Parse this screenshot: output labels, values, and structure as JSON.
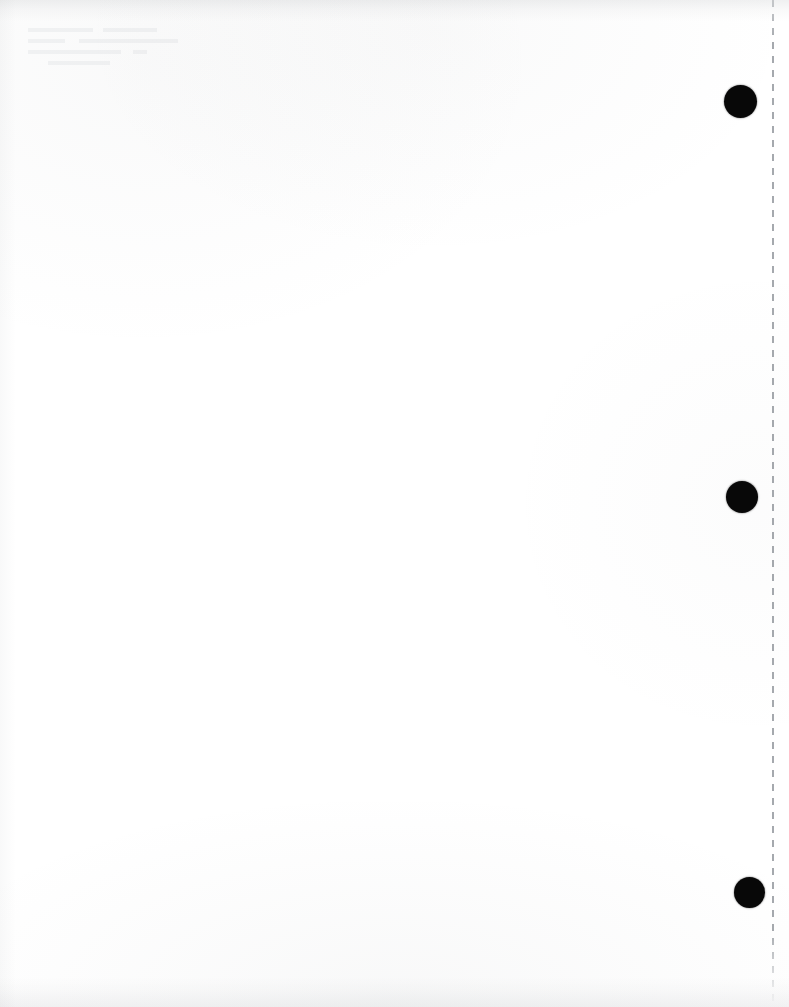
{
  "document": {
    "kind": "scanned-page",
    "title": "Blank scanned document page",
    "page_width": 789,
    "page_height": 1007,
    "background_color": "#ffffff",
    "content_text": "",
    "notes": "Blank paper scan; no printed body text is visible."
  },
  "marks": {
    "dashed_rule": {
      "name": "vertical dashed guide line",
      "orientation": "vertical",
      "color": "#6e747c",
      "x": 773,
      "top": 0,
      "bottom": 1007,
      "dash_length_px": 7,
      "gap_length_px": 7,
      "stroke_width_px": 2
    },
    "ink_dots": [
      {
        "label": "ink-dot-top",
        "color": "#080808",
        "center_x": 740,
        "center_y": 101,
        "diameter": 33
      },
      {
        "label": "ink-dot-middle",
        "color": "#080808",
        "center_x": 742,
        "center_y": 497,
        "diameter": 32
      },
      {
        "label": "ink-dot-bottom",
        "color": "#080808",
        "center_x": 749,
        "center_y": 892,
        "diameter": 31
      }
    ]
  },
  "artifacts": {
    "top_edge_shadow": "#696e74",
    "bottom_edge_shadow": "#696e74",
    "left_edge_shadow": "#696e74",
    "ghost_text_corner": "upper-left"
  }
}
